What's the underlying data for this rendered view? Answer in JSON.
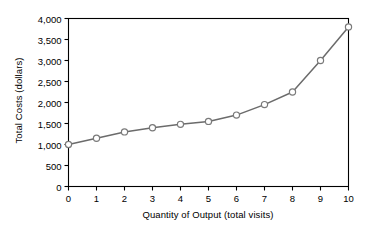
{
  "chart_data": {
    "type": "line",
    "title": "",
    "xlabel": "Quantity of Output (total visits)",
    "ylabel": "Total Costs (dollars)",
    "x": [
      0,
      1,
      2,
      3,
      4,
      5,
      6,
      7,
      8,
      9,
      10
    ],
    "values": [
      1000,
      1150,
      1300,
      1400,
      1480,
      1550,
      1700,
      1950,
      2250,
      3000,
      3800
    ],
    "series": [
      {
        "name": "Total Costs",
        "values": [
          1000,
          1150,
          1300,
          1400,
          1480,
          1550,
          1700,
          1950,
          2250,
          3000,
          3800
        ]
      }
    ],
    "xlim": [
      0,
      10
    ],
    "ylim": [
      0,
      4000
    ],
    "xticks": [
      0,
      1,
      2,
      3,
      4,
      5,
      6,
      7,
      8,
      9,
      10
    ],
    "yticks": [
      0,
      500,
      1000,
      1500,
      2000,
      2500,
      3000,
      3500,
      4000
    ],
    "xtick_labels": [
      "0",
      "1",
      "2",
      "3",
      "4",
      "5",
      "6",
      "7",
      "8",
      "9",
      "10"
    ],
    "ytick_labels": [
      "0",
      "500",
      "1,000",
      "1,500",
      "2,000",
      "2,500",
      "3,000",
      "3,500",
      "4,000"
    ],
    "grid": false,
    "legend": false,
    "legend_position": "none",
    "marker": "circle-open",
    "line_color": "#6b6b6b",
    "marker_fill": "#ffffff",
    "marker_stroke": "#7a7a7a",
    "axis_color": "#000000",
    "plot_border": true
  }
}
